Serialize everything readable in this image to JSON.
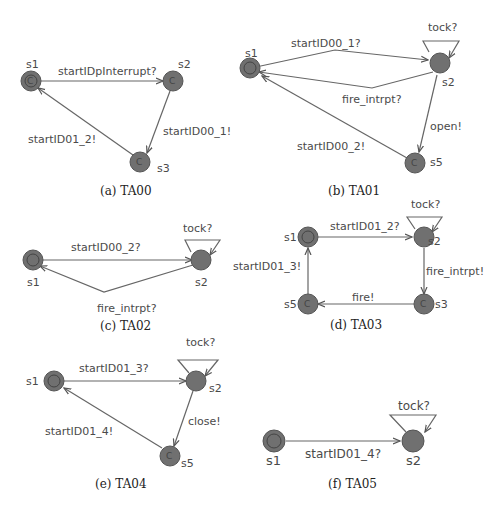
{
  "figures": [
    {
      "id": "TA00",
      "caption": "(a) TA00",
      "states": [
        {
          "id": "s1",
          "label": "s1",
          "initial": true,
          "committed": true
        },
        {
          "id": "s2",
          "label": "s2",
          "committed": true
        },
        {
          "id": "s3",
          "label": "s3",
          "committed": true
        }
      ],
      "edges": [
        {
          "from": "s1",
          "to": "s2",
          "label": "startIDpInterrupt?"
        },
        {
          "from": "s2",
          "to": "s3",
          "label": "startID00_1!"
        },
        {
          "from": "s3",
          "to": "s1",
          "label": "startID01_2!"
        }
      ]
    },
    {
      "id": "TA01",
      "caption": "(b) TA01",
      "states": [
        {
          "id": "s1",
          "label": "s1",
          "initial": true
        },
        {
          "id": "s2",
          "label": "s2"
        },
        {
          "id": "s5",
          "label": "s5",
          "committed": true
        }
      ],
      "edges": [
        {
          "from": "s1",
          "to": "s2",
          "label": "startID00_1?"
        },
        {
          "from": "s2",
          "to": "s2",
          "label": "tock?"
        },
        {
          "from": "s2",
          "to": "s1",
          "label": "fire_intrpt?"
        },
        {
          "from": "s2",
          "to": "s5",
          "label": "open!"
        },
        {
          "from": "s5",
          "to": "s1",
          "label": "startID00_2!"
        }
      ]
    },
    {
      "id": "TA02",
      "caption": "(c) TA02",
      "states": [
        {
          "id": "s1",
          "label": "s1",
          "initial": true
        },
        {
          "id": "s2",
          "label": "s2"
        }
      ],
      "edges": [
        {
          "from": "s1",
          "to": "s2",
          "label": "startID00_2?"
        },
        {
          "from": "s2",
          "to": "s2",
          "label": "tock?"
        },
        {
          "from": "s2",
          "to": "s1",
          "label": "fire_intrpt?"
        }
      ]
    },
    {
      "id": "TA03",
      "caption": "(d) TA03",
      "states": [
        {
          "id": "s1",
          "label": "s1",
          "initial": true
        },
        {
          "id": "s2",
          "label": "s2"
        },
        {
          "id": "s3",
          "label": "s3",
          "committed": true
        },
        {
          "id": "s5",
          "label": "s5",
          "committed": true
        }
      ],
      "edges": [
        {
          "from": "s1",
          "to": "s2",
          "label": "startID01_2?"
        },
        {
          "from": "s2",
          "to": "s2",
          "label": "tock?"
        },
        {
          "from": "s2",
          "to": "s3",
          "label": "fire_intrpt!"
        },
        {
          "from": "s3",
          "to": "s5",
          "label": "fire!"
        },
        {
          "from": "s5",
          "to": "s1",
          "label": "startID01_3!"
        }
      ]
    },
    {
      "id": "TA04",
      "caption": "(e) TA04",
      "states": [
        {
          "id": "s1",
          "label": "s1",
          "initial": true
        },
        {
          "id": "s2",
          "label": "s2"
        },
        {
          "id": "s5",
          "label": "s5",
          "committed": true
        }
      ],
      "edges": [
        {
          "from": "s1",
          "to": "s2",
          "label": "startID01_3?"
        },
        {
          "from": "s2",
          "to": "s2",
          "label": "tock?"
        },
        {
          "from": "s2",
          "to": "s5",
          "label": "close!"
        },
        {
          "from": "s5",
          "to": "s1",
          "label": "startID01_4!"
        }
      ]
    },
    {
      "id": "TA05",
      "caption": "(f) TA05",
      "states": [
        {
          "id": "s1",
          "label": "s1",
          "initial": true
        },
        {
          "id": "s2",
          "label": "s2"
        }
      ],
      "edges": [
        {
          "from": "s1",
          "to": "s2",
          "label": "startID01_4?"
        },
        {
          "from": "s2",
          "to": "s2",
          "label": "tock?"
        }
      ]
    }
  ],
  "committed_marker": "C",
  "colors": {
    "node": "#707070",
    "edge": "#666666",
    "text": "#4a4a4a"
  }
}
